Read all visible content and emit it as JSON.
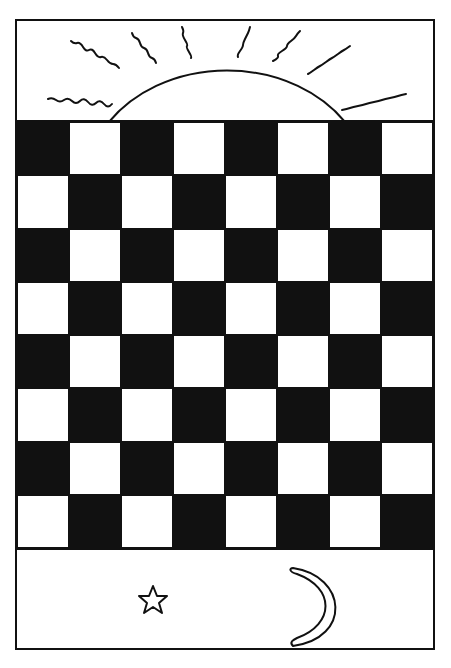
{
  "card": {
    "frame_color": "#111111",
    "background": "#ffffff"
  },
  "sky_panel": {
    "icon": "rising-sun-icon",
    "ray_count": 9
  },
  "board": {
    "rows": 8,
    "columns": 8,
    "first_square": "dark",
    "dark_color": "#111111",
    "light_color": "#ffffff"
  },
  "night_panel": {
    "icons": [
      "star-icon",
      "crescent-moon-icon"
    ]
  }
}
